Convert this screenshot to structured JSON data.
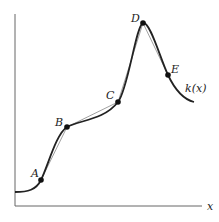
{
  "figure": {
    "function_label": "k(x)",
    "x_axis_label": "x",
    "points": [
      {
        "label": "A",
        "x": 41,
        "y": 180
      },
      {
        "label": "B",
        "x": 67,
        "y": 127
      },
      {
        "label": "C",
        "x": 118,
        "y": 102
      },
      {
        "label": "D",
        "x": 143,
        "y": 23
      },
      {
        "label": "E",
        "x": 168,
        "y": 75
      }
    ],
    "colors": {
      "curve": "#222222",
      "secant": "#666666",
      "axis": "#555555"
    }
  }
}
